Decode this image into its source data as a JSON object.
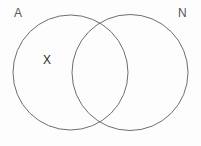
{
  "diagram": {
    "type": "venn",
    "title": "",
    "background_color": "#fdfdfd",
    "stroke_color": "#6e6e6e",
    "stroke_width": 1,
    "width": 201,
    "height": 146,
    "sets": [
      {
        "id": "A",
        "label": "A",
        "label_position": "top-left",
        "cx": 70.5,
        "cy": 72.5,
        "r": 57.5,
        "fill": "none"
      },
      {
        "id": "N",
        "label": "N",
        "label_position": "top-right",
        "cx": 130,
        "cy": 72.5,
        "r": 58,
        "fill": "none"
      }
    ],
    "elements": [
      {
        "id": "x",
        "glyph": "X",
        "label": "X",
        "region": "A-only",
        "x": 47.5,
        "y": 60,
        "color": "#2b2b2b"
      }
    ],
    "intersection": {
      "top_point": {
        "x": 100,
        "y": 18
      },
      "bottom_point": {
        "x": 100,
        "y": 129
      },
      "shaded": false
    }
  }
}
